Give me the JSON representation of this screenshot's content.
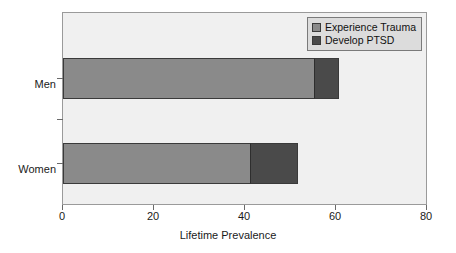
{
  "chart_data": {
    "type": "bar",
    "orientation": "horizontal",
    "stacked": true,
    "title": "",
    "xlabel": "Lifetime Prevalence",
    "ylabel": "",
    "xlim": [
      0,
      80
    ],
    "xticks": [
      0,
      20,
      40,
      60,
      80
    ],
    "xtick_labels": [
      "0",
      "20",
      "40",
      "60",
      "80"
    ],
    "categories": [
      "Men",
      "Women"
    ],
    "grid": false,
    "legend_position": "top-right",
    "series": [
      {
        "name": "Experience Trauma",
        "color": "#8a8a8a",
        "values": [
          55,
          41
        ]
      },
      {
        "name": "Develop PTSD",
        "color": "#4a4a4a",
        "values": [
          5.5,
          10.5
        ]
      }
    ],
    "cumulative_totals": [
      60.5,
      51.5
    ],
    "plot_background": "#f0f0f0",
    "figure_background": "#ffffff"
  },
  "legend": {
    "items": [
      {
        "label": "Experience Trauma",
        "color": "#8a8a8a"
      },
      {
        "label": "Develop PTSD",
        "color": "#4a4a4a"
      }
    ]
  },
  "axes": {
    "x_title": "Lifetime Prevalence",
    "x_labels": [
      "0",
      "20",
      "40",
      "60",
      "80"
    ],
    "y_labels": [
      "Men",
      "Women"
    ]
  }
}
